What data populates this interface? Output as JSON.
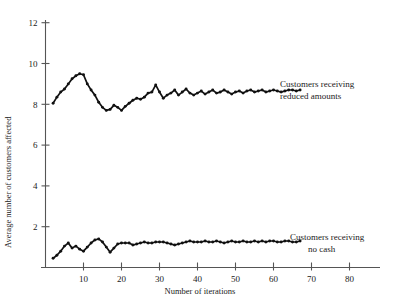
{
  "chart_data": {
    "type": "line",
    "title": "",
    "xlabel": "Number of iterations",
    "ylabel": "Average number of customers affected",
    "xlim": [
      0,
      86
    ],
    "ylim": [
      0,
      12.6
    ],
    "grid": false,
    "legend_position": "inline-annotation-right",
    "xticks": [
      10,
      20,
      30,
      40,
      50,
      60,
      70,
      80
    ],
    "xtick_labels": [
      "10",
      "20",
      "30",
      "40",
      "50",
      "60",
      "70",
      "80"
    ],
    "yticks": [
      2,
      4,
      6,
      8,
      10,
      12
    ],
    "ytick_labels": [
      "2",
      "4",
      "6",
      "8",
      "10",
      "12"
    ],
    "series": [
      {
        "name": "Customers receiving reduced amounts",
        "annotation_line1": "Customers receiving",
        "annotation_line2": "reduced amounts",
        "color": "#111111",
        "x": [
          2,
          3,
          4,
          5,
          6,
          7,
          8,
          9,
          10,
          11,
          12,
          13,
          14,
          15,
          16,
          17,
          18,
          19,
          20,
          21,
          22,
          23,
          24,
          25,
          26,
          27,
          28,
          29,
          30,
          31,
          32,
          33,
          34,
          35,
          36,
          37,
          38,
          39,
          40,
          41,
          42,
          43,
          44,
          45,
          46,
          47,
          48,
          49,
          50,
          51,
          52,
          53,
          54,
          55,
          56,
          57,
          58,
          59,
          60,
          61,
          62,
          63,
          64,
          65,
          66,
          67
        ],
        "values": [
          8.05,
          8.35,
          8.6,
          8.75,
          9.0,
          9.25,
          9.4,
          9.5,
          9.45,
          9.0,
          8.7,
          8.45,
          8.1,
          7.85,
          7.7,
          7.75,
          7.95,
          7.85,
          7.7,
          7.9,
          8.05,
          8.2,
          8.3,
          8.25,
          8.35,
          8.55,
          8.6,
          8.95,
          8.6,
          8.3,
          8.45,
          8.55,
          8.7,
          8.45,
          8.6,
          8.75,
          8.55,
          8.45,
          8.55,
          8.65,
          8.5,
          8.6,
          8.7,
          8.55,
          8.6,
          8.7,
          8.6,
          8.5,
          8.6,
          8.65,
          8.55,
          8.65,
          8.7,
          8.6,
          8.65,
          8.7,
          8.6,
          8.65,
          8.7,
          8.65,
          8.6,
          8.65,
          8.7,
          8.7,
          8.65,
          8.7
        ]
      },
      {
        "name": "Customers receiving no cash",
        "annotation_line1": "Customers receiving",
        "annotation_line2": "no cash",
        "color": "#111111",
        "x": [
          2,
          3,
          4,
          5,
          6,
          7,
          8,
          9,
          10,
          11,
          12,
          13,
          14,
          15,
          16,
          17,
          18,
          19,
          20,
          21,
          22,
          23,
          24,
          25,
          26,
          27,
          28,
          29,
          30,
          31,
          32,
          33,
          34,
          35,
          36,
          37,
          38,
          39,
          40,
          41,
          42,
          43,
          44,
          45,
          46,
          47,
          48,
          49,
          50,
          51,
          52,
          53,
          54,
          55,
          56,
          57,
          58,
          59,
          60,
          61,
          62,
          63,
          64,
          65,
          66,
          67
        ],
        "values": [
          0.45,
          0.6,
          0.8,
          1.05,
          1.2,
          0.95,
          1.05,
          0.9,
          0.8,
          1.0,
          1.2,
          1.35,
          1.4,
          1.25,
          1.0,
          0.75,
          0.95,
          1.15,
          1.2,
          1.2,
          1.2,
          1.1,
          1.15,
          1.2,
          1.25,
          1.2,
          1.2,
          1.25,
          1.25,
          1.25,
          1.2,
          1.15,
          1.1,
          1.15,
          1.2,
          1.25,
          1.3,
          1.25,
          1.25,
          1.25,
          1.3,
          1.25,
          1.25,
          1.3,
          1.25,
          1.2,
          1.25,
          1.3,
          1.25,
          1.25,
          1.3,
          1.25,
          1.25,
          1.3,
          1.25,
          1.3,
          1.25,
          1.3,
          1.3,
          1.25,
          1.25,
          1.3,
          1.3,
          1.25,
          1.25,
          1.3
        ]
      }
    ]
  },
  "axes": {
    "y_label": "Average number of customers affected",
    "x_label": "Number of iterations"
  },
  "annotations": {
    "upper": {
      "line1": "Customers receiving",
      "line2": "reduced amounts"
    },
    "lower": {
      "line1": "Customers receiving",
      "line2": "no cash"
    }
  }
}
